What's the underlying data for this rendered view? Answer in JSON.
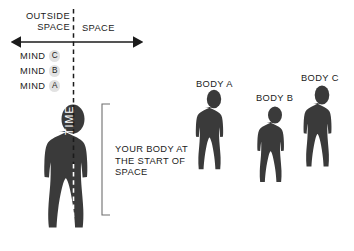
{
  "diagram": {
    "title_region": {
      "outside_space_label": "OUTSIDE SPACE",
      "space_label": "SPACE"
    },
    "axis": {
      "name": "space-axis",
      "type": "double-headed-arrow",
      "divider": "dashed-vertical-line"
    },
    "mind_rows": [
      {
        "word": "MIND",
        "badge": "C"
      },
      {
        "word": "MIND",
        "badge": "B"
      },
      {
        "word": "MIND",
        "badge": "A"
      }
    ],
    "main_figure": {
      "vertical_label": "TIME",
      "note": "YOUR BODY AT THE START OF SPACE",
      "bracket": "vertical-bracket"
    },
    "bodies": [
      {
        "label": "BODY A"
      },
      {
        "label": "BODY B"
      },
      {
        "label": "BODY C"
      }
    ],
    "colors": {
      "silhouette": "#3a3a3a",
      "text": "#1b1b1b",
      "badge_fill": "#e2e2e2",
      "background": "#ffffff"
    }
  }
}
